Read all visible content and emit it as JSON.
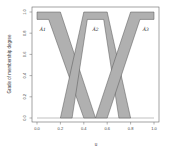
{
  "chart_data": {
    "type": "area",
    "title": "",
    "xlabel": "u",
    "ylabel": "Grade of membership degree",
    "xlim": [
      0,
      1
    ],
    "ylim": [
      0,
      1
    ],
    "x_ticks": [
      "0.0",
      "0.2",
      "0.4",
      "0.6",
      "0.8",
      "1.0"
    ],
    "y_ticks": [
      "0.0",
      "0.2",
      "0.4",
      "0.6",
      "0.8",
      "1.0"
    ],
    "grid": false,
    "legend": "none",
    "fill_color": "#b0b0b0",
    "edge_color": "#555555",
    "series": [
      {
        "name": "Ã1",
        "upper": [
          [
            0,
            1
          ],
          [
            0.2,
            1
          ],
          [
            0.5,
            0
          ]
        ],
        "lower": [
          [
            0,
            0.93
          ],
          [
            0.1,
            0.93
          ],
          [
            0.4,
            0
          ]
        ]
      },
      {
        "name": "Ã2",
        "upper": [
          [
            0.2,
            0
          ],
          [
            0.4,
            1
          ],
          [
            0.6,
            1
          ],
          [
            0.8,
            0
          ]
        ],
        "lower": [
          [
            0.3,
            0
          ],
          [
            0.43,
            0.93
          ],
          [
            0.57,
            0.93
          ],
          [
            0.7,
            0
          ]
        ]
      },
      {
        "name": "Ã3",
        "upper": [
          [
            0.5,
            0
          ],
          [
            0.8,
            1
          ],
          [
            1,
            1
          ]
        ],
        "lower": [
          [
            0.6,
            0
          ],
          [
            0.88,
            0.93
          ],
          [
            1,
            0.93
          ]
        ]
      }
    ],
    "annotations": [
      "Ã1",
      "Ã2",
      "Ã3"
    ]
  }
}
